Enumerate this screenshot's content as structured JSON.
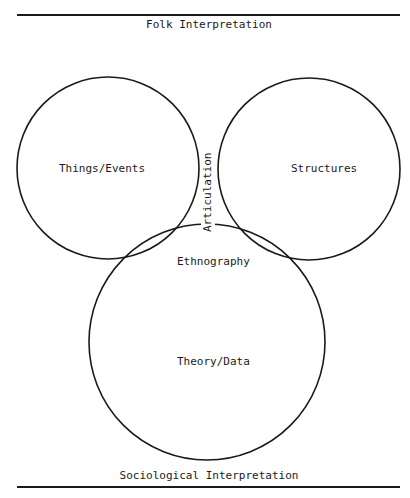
{
  "diagram": {
    "type": "venn",
    "top_caption": "Folk Interpretation",
    "bottom_caption": "Sociological Interpretation",
    "sets": [
      {
        "id": "things-events",
        "label": "Things/Events",
        "position": "upper-left"
      },
      {
        "id": "structures",
        "label": "Structures",
        "position": "upper-right"
      },
      {
        "id": "theory-data",
        "label": "Theory/Data",
        "position": "bottom"
      }
    ],
    "intersections": [
      {
        "id": "articulation",
        "label": "Articulation",
        "between": [
          "things-events",
          "structures"
        ],
        "orientation": "vertical"
      },
      {
        "id": "ethnography",
        "label": "Ethnography",
        "between": [
          "things-events",
          "structures",
          "theory-data"
        ]
      }
    ],
    "colors": {
      "line": "#1a1a1a",
      "background": "#ffffff"
    }
  }
}
